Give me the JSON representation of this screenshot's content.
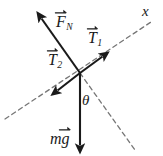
{
  "figure": {
    "background_color": "#ffffff",
    "stroke_color": "#1a1a1a",
    "dashed_color": "#767676",
    "origin": {
      "x": 80,
      "y": 73
    },
    "labels": {
      "normal_force": {
        "base": "F",
        "subscript": "N",
        "vector": true
      },
      "tension_one": {
        "base": "T",
        "subscript": "1",
        "vector": true
      },
      "tension_two": {
        "base": "T",
        "subscript": "2",
        "vector": true
      },
      "weight": {
        "base": "mg",
        "subscript": "",
        "vector": true
      },
      "angle": "θ",
      "axis_x": "x"
    },
    "vectors": [
      {
        "name": "normal-force",
        "label": "F_N",
        "from": {
          "x": 80,
          "y": 73
        },
        "to": {
          "x": 38,
          "y": 14
        },
        "style": "solid",
        "arrowhead": "end"
      },
      {
        "name": "tension-1",
        "label": "T_1",
        "from": {
          "x": 80,
          "y": 73
        },
        "to": {
          "x": 106,
          "y": 54
        },
        "style": "solid",
        "arrowhead": "end"
      },
      {
        "name": "tension-2",
        "label": "T_2",
        "from": {
          "x": 80,
          "y": 73
        },
        "to": {
          "x": 54,
          "y": 93
        },
        "style": "solid",
        "arrowhead": "end"
      },
      {
        "name": "weight",
        "label": "mg",
        "from": {
          "x": 80,
          "y": 73
        },
        "to": {
          "x": 80,
          "y": 151
        },
        "style": "solid",
        "arrowhead": "end"
      }
    ],
    "guides": [
      {
        "name": "x-axis",
        "label": "x",
        "from": {
          "x": 5,
          "y": 119
        },
        "to": {
          "x": 151,
          "y": 22
        },
        "style": "dashed"
      },
      {
        "name": "reference-line",
        "label": "",
        "from": {
          "x": 80,
          "y": 73
        },
        "to": {
          "x": 135,
          "y": 150
        },
        "style": "dashed"
      }
    ],
    "angle_mark": {
      "name": "theta",
      "symbol": "θ",
      "between": [
        "weight",
        "reference-line"
      ],
      "position": {
        "x": 86,
        "y": 101
      }
    }
  }
}
